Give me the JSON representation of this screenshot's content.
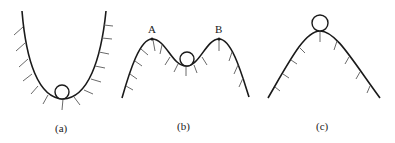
{
  "figure": {
    "panels": [
      {
        "id": "a",
        "label": "(a)",
        "description": "ball at bottom of valley (stable equilibrium)"
      },
      {
        "id": "b",
        "label": "(b)",
        "description": "ball in dip between two peaks (neutral/metastable)",
        "peaks": [
          {
            "label": "A"
          },
          {
            "label": "B"
          }
        ]
      },
      {
        "id": "c",
        "label": "(c)",
        "description": "ball on top of hill (unstable equilibrium)"
      }
    ],
    "colors": {
      "curve": "#1a1a1a",
      "hatch": "#6a6a6a",
      "background": "#ffffff"
    }
  }
}
